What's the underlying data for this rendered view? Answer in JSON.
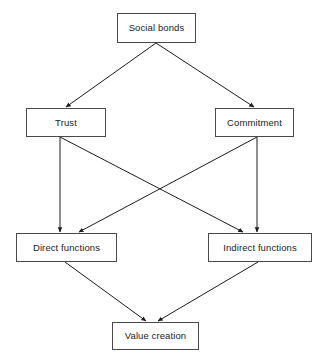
{
  "diagram": {
    "type": "flowchart",
    "background_color": "#ffffff",
    "line_color": "#1c1c1c",
    "box_border_color": "#4a4a4a",
    "text_color": "#1c1c1c",
    "nodes": [
      {
        "id": "social-bonds",
        "label": "Social bonds",
        "level": 1,
        "x": 117,
        "y": 13,
        "width": 79,
        "height": 30
      },
      {
        "id": "trust",
        "label": "Trust",
        "level": 2,
        "x": 26,
        "y": 108,
        "width": 80,
        "height": 29
      },
      {
        "id": "commitment",
        "label": "Commitment",
        "level": 2,
        "x": 215,
        "y": 108,
        "width": 79,
        "height": 29
      },
      {
        "id": "direct-functions",
        "label": "Direct functions",
        "level": 3,
        "x": 16,
        "y": 233,
        "width": 101,
        "height": 29
      },
      {
        "id": "indirect-functions",
        "label": "Indirect functions",
        "level": 3,
        "x": 208,
        "y": 233,
        "width": 104,
        "height": 29
      },
      {
        "id": "value-creation",
        "label": "Value creation",
        "level": 4,
        "x": 112,
        "y": 322,
        "width": 87,
        "height": 28
      }
    ],
    "edges": [
      {
        "id": "social-bonds-to-trust",
        "from": "social-bonds",
        "to": "trust",
        "x1": 156,
        "y1": 43,
        "x2": 66,
        "y2": 107,
        "arrowhead": true
      },
      {
        "id": "social-bonds-to-commitment",
        "from": "social-bonds",
        "to": "commitment",
        "x1": 156,
        "y1": 43,
        "x2": 254,
        "y2": 107,
        "arrowhead": true
      },
      {
        "id": "trust-to-direct-functions",
        "from": "trust",
        "to": "direct-functions",
        "x1": 60,
        "y1": 137,
        "x2": 60,
        "y2": 232,
        "arrowhead": true
      },
      {
        "id": "trust-to-indirect-functions",
        "from": "trust",
        "to": "indirect-functions",
        "x1": 60,
        "y1": 137,
        "x2": 243,
        "y2": 232,
        "arrowhead": true
      },
      {
        "id": "commitment-to-indirect-functions",
        "from": "commitment",
        "to": "indirect-functions",
        "x1": 257,
        "y1": 137,
        "x2": 257,
        "y2": 232,
        "arrowhead": true
      },
      {
        "id": "commitment-to-direct-functions",
        "from": "commitment",
        "to": "direct-functions",
        "x1": 257,
        "y1": 137,
        "x2": 79,
        "y2": 232,
        "arrowhead": true
      },
      {
        "id": "direct-functions-to-value-creation",
        "from": "direct-functions",
        "to": "value-creation",
        "x1": 65,
        "y1": 262,
        "x2": 146,
        "y2": 321,
        "arrowhead": true
      },
      {
        "id": "indirect-functions-to-value-creation",
        "from": "indirect-functions",
        "to": "value-creation",
        "x1": 258,
        "y1": 262,
        "x2": 158,
        "y2": 321,
        "arrowhead": true
      }
    ]
  }
}
